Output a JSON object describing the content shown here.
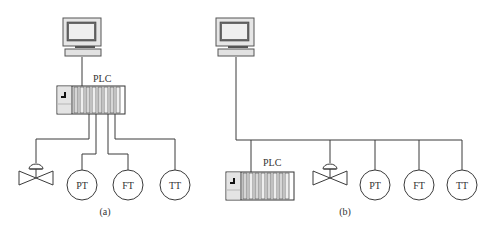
{
  "diagram_a": {
    "caption": "(a)",
    "plc_label": "PLC",
    "instruments": [
      {
        "type": "valve",
        "label": ""
      },
      {
        "type": "transmitter",
        "label": "PT"
      },
      {
        "type": "transmitter",
        "label": "FT"
      },
      {
        "type": "transmitter",
        "label": "TT"
      }
    ],
    "topology": "point-to-point wiring from PLC I/O modules to each field device"
  },
  "diagram_b": {
    "caption": "(b)",
    "plc_label": "PLC",
    "instruments": [
      {
        "type": "valve",
        "label": ""
      },
      {
        "type": "transmitter",
        "label": "PT"
      },
      {
        "type": "transmitter",
        "label": "FT"
      },
      {
        "type": "transmitter",
        "label": "TT"
      }
    ],
    "topology": "shared fieldbus connecting computer, PLC and field devices"
  },
  "colors": {
    "line": "#3a3a3a",
    "module_fill": "#d8d8d8",
    "monitor_frame": "#e6e6e6",
    "monitor_screen": "#ededed"
  }
}
